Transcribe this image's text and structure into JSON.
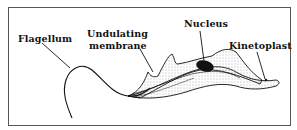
{
  "diagram": {
    "labels": {
      "flagellum": "Flagellum",
      "undulating_line1": "Undulating",
      "undulating_line2": "membrane",
      "nucleus": "Nucleus",
      "kinetoplast": "Kinetoplast"
    },
    "colors": {
      "ink": "#111111",
      "border": "#555555",
      "background": "#ffffff"
    }
  }
}
